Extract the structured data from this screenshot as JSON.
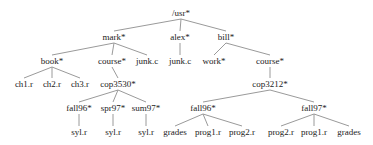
{
  "diagram": {
    "type": "directory-tree",
    "colors": {
      "edge": "#9a9a9a",
      "text": "#222222",
      "background": "#ffffff"
    },
    "nodes": [
      {
        "id": "usr",
        "label": "/usr*",
        "x": 181,
        "y": 13,
        "parent": null
      },
      {
        "id": "mark",
        "label": "mark*",
        "x": 114,
        "y": 37,
        "parent": "usr"
      },
      {
        "id": "alex",
        "label": "alex*",
        "x": 180,
        "y": 37,
        "parent": "usr"
      },
      {
        "id": "bill",
        "label": "bill*",
        "x": 226,
        "y": 37,
        "parent": "usr"
      },
      {
        "id": "book",
        "label": "book*",
        "x": 52,
        "y": 61,
        "parent": "mark"
      },
      {
        "id": "mark_course",
        "label": "course*",
        "x": 112,
        "y": 61,
        "parent": "mark"
      },
      {
        "id": "mark_junk",
        "label": "junk.c",
        "x": 147,
        "y": 61,
        "parent": "mark"
      },
      {
        "id": "alex_junk",
        "label": "junk.c",
        "x": 180,
        "y": 61,
        "parent": "alex"
      },
      {
        "id": "work",
        "label": "work*",
        "x": 214,
        "y": 61,
        "parent": "bill"
      },
      {
        "id": "bill_course",
        "label": "course*",
        "x": 270,
        "y": 61,
        "parent": "bill"
      },
      {
        "id": "ch1",
        "label": "ch1.r",
        "x": 24,
        "y": 84,
        "parent": "book"
      },
      {
        "id": "ch2",
        "label": "ch2.r",
        "x": 52,
        "y": 84,
        "parent": "book"
      },
      {
        "id": "ch3",
        "label": "ch3.r",
        "x": 80,
        "y": 84,
        "parent": "book"
      },
      {
        "id": "cop3530",
        "label": "cop3530*",
        "x": 118,
        "y": 84,
        "parent": "mark_course"
      },
      {
        "id": "cop3212",
        "label": "cop3212*",
        "x": 270,
        "y": 84,
        "parent": "bill_course"
      },
      {
        "id": "m_fall96",
        "label": "fall96*",
        "x": 79,
        "y": 108,
        "parent": "cop3530"
      },
      {
        "id": "spr97",
        "label": "spr97*",
        "x": 113,
        "y": 108,
        "parent": "cop3530"
      },
      {
        "id": "sum97",
        "label": "sum97*",
        "x": 146,
        "y": 108,
        "parent": "cop3530"
      },
      {
        "id": "b_fall96",
        "label": "fall96*",
        "x": 203,
        "y": 108,
        "parent": "cop3212"
      },
      {
        "id": "b_fall97",
        "label": "fall97*",
        "x": 314,
        "y": 108,
        "parent": "cop3212"
      },
      {
        "id": "syl1",
        "label": "syl.r",
        "x": 79,
        "y": 132,
        "parent": "m_fall96"
      },
      {
        "id": "syl2",
        "label": "syl.r",
        "x": 113,
        "y": 132,
        "parent": "spr97"
      },
      {
        "id": "syl3",
        "label": "syl.r",
        "x": 146,
        "y": 132,
        "parent": "sum97"
      },
      {
        "id": "grades1",
        "label": "grades",
        "x": 175,
        "y": 132,
        "parent": "b_fall96"
      },
      {
        "id": "prog1a",
        "label": "prog1.r",
        "x": 208,
        "y": 132,
        "parent": "b_fall96"
      },
      {
        "id": "prog2a",
        "label": "prog2.r",
        "x": 242,
        "y": 132,
        "parent": "b_fall96"
      },
      {
        "id": "prog2b",
        "label": "prog2.r",
        "x": 281,
        "y": 132,
        "parent": "b_fall97"
      },
      {
        "id": "prog1b",
        "label": "prog1.r",
        "x": 314,
        "y": 132,
        "parent": "b_fall97"
      },
      {
        "id": "grades2",
        "label": "grades",
        "x": 349,
        "y": 132,
        "parent": "b_fall97"
      }
    ]
  }
}
